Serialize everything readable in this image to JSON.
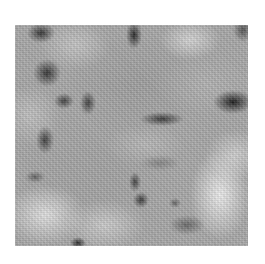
{
  "image": {
    "subject": "grayscale mottled texture",
    "colors": {
      "background": "#ffffff",
      "base_gray": "#a9a9a9",
      "dark_blotch": "#1e1e1e",
      "light_patch": "#f0f0f0"
    }
  }
}
